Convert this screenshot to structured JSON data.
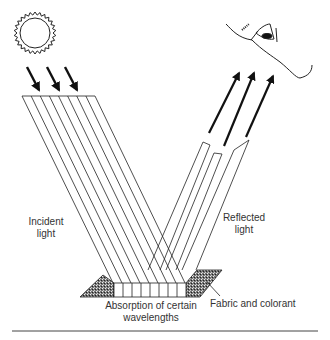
{
  "diagram": {
    "title_fragment": "",
    "labels": {
      "incident": [
        "Incident",
        "light"
      ],
      "reflected": [
        "Reflected",
        "light"
      ],
      "absorption": [
        "Absorption of certain",
        "wavelengths"
      ],
      "fabric": "Fabric and colorant"
    },
    "elements": {
      "light_source": "sun-icon",
      "observer": "eye-face-icon",
      "incident_arrow_count": 3,
      "incident_ray_lines": 9,
      "reflected_channels": 3,
      "reflected_arrow_count": 3
    },
    "colors": {
      "ink": "#111111",
      "text": "#333333",
      "background": "#ffffff"
    }
  }
}
